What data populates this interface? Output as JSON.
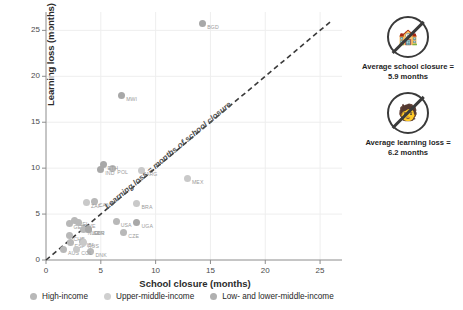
{
  "chart_data": {
    "type": "scatter",
    "title": "",
    "xlabel": "School closure (months)",
    "ylabel": "Learning loss (months)",
    "xlim": [
      0,
      27
    ],
    "ylim": [
      0,
      27
    ],
    "xticks": [
      0,
      5,
      10,
      15,
      20,
      25
    ],
    "yticks": [
      0,
      5,
      10,
      15,
      20,
      25
    ],
    "grid": true,
    "legend_position": "bottom",
    "reference_line": {
      "label": "Learning loss = months of school closure",
      "style": "dashed",
      "from": [
        0,
        0
      ],
      "to": [
        26,
        26
      ]
    },
    "series": [
      {
        "name": "High-income",
        "color": "#b8b8b8",
        "points": [
          {
            "label": "POL",
            "x": 6.1,
            "y": 10.0
          },
          {
            "label": "CAN",
            "x": 4.4,
            "y": 6.4
          },
          {
            "label": "BEL",
            "x": 2.6,
            "y": 4.3
          },
          {
            "label": "GER",
            "x": 2.1,
            "y": 4.0
          },
          {
            "label": "CHE",
            "x": 2.1,
            "y": 2.7
          },
          {
            "label": "USA",
            "x": 6.4,
            "y": 4.2
          },
          {
            "label": "CZE",
            "x": 7.1,
            "y": 3.0
          },
          {
            "label": "SWE",
            "x": 3.0,
            "y": 4.1
          },
          {
            "label": "NLD",
            "x": 3.4,
            "y": 3.3
          },
          {
            "label": "GBR",
            "x": 3.9,
            "y": 3.3
          },
          {
            "label": "DNK",
            "x": 4.1,
            "y": 0.9
          },
          {
            "label": "AUS",
            "x": 1.6,
            "y": 1.1
          },
          {
            "label": "ITA",
            "x": 3.3,
            "y": 2.0
          },
          {
            "label": "ESP",
            "x": 2.2,
            "y": 1.9
          }
        ]
      },
      {
        "name": "Upper-middle-income",
        "color": "#c9c9c9",
        "points": [
          {
            "label": "MEX",
            "x": 12.9,
            "y": 8.9
          },
          {
            "label": "ARG",
            "x": 8.7,
            "y": 9.7
          },
          {
            "label": "BRA",
            "x": 8.3,
            "y": 6.2
          },
          {
            "label": "ZAF",
            "x": 3.7,
            "y": 6.3
          },
          {
            "label": "RUS",
            "x": 3.4,
            "y": 1.9
          },
          {
            "label": "COL",
            "x": 2.8,
            "y": 1.1
          }
        ]
      },
      {
        "name": "Low- and lower-middle-income",
        "color": "#a8a8a8",
        "points": [
          {
            "label": "BGD",
            "x": 14.3,
            "y": 25.8
          },
          {
            "label": "MWI",
            "x": 6.9,
            "y": 17.9
          },
          {
            "label": "ETH",
            "x": 5.2,
            "y": 10.4
          },
          {
            "label": "UGA",
            "x": 8.3,
            "y": 4.1
          },
          {
            "label": "IND",
            "x": 5.0,
            "y": 9.9
          },
          {
            "label": "KEN",
            "x": 3.9,
            "y": 3.3
          }
        ]
      }
    ]
  },
  "legend": {
    "items": [
      {
        "label": "High-income",
        "color": "#b8b8b8"
      },
      {
        "label": "Upper-middle-income",
        "color": "#cfcfcf"
      },
      {
        "label": "Low- and lower-middle-income",
        "color": "#b0b0b0"
      }
    ]
  },
  "annotations": {
    "closure": {
      "icon": "no-school-icon",
      "glyph": "ἾB",
      "line1": "Average school closure =",
      "line2": "5.9 months"
    },
    "loss": {
      "icon": "no-learning-icon",
      "glyph": "ᾝ1",
      "line1": "Average learning loss =",
      "line2": "6.2 months"
    }
  }
}
